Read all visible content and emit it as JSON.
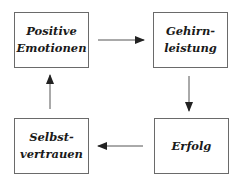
{
  "diagram": {
    "type": "cycle",
    "nodes": [
      {
        "id": "positive-emotionen",
        "lines": [
          "Positive",
          "Emotionen"
        ]
      },
      {
        "id": "gehirnleistung",
        "lines": [
          "Gehirn-",
          "leistung"
        ]
      },
      {
        "id": "erfolg",
        "lines": [
          "Erfolg"
        ]
      },
      {
        "id": "selbstvertrauen",
        "lines": [
          "Selbst-",
          "vertrauen"
        ]
      }
    ],
    "edges": [
      {
        "from": "positive-emotionen",
        "to": "gehirnleistung"
      },
      {
        "from": "gehirnleistung",
        "to": "erfolg"
      },
      {
        "from": "erfolg",
        "to": "selbstvertrauen"
      },
      {
        "from": "selbstvertrauen",
        "to": "positive-emotionen"
      }
    ],
    "colors": {
      "border": "#6a6a6a",
      "arrow": "#222222",
      "text": "#1a1a1a",
      "background": "#ffffff"
    }
  }
}
